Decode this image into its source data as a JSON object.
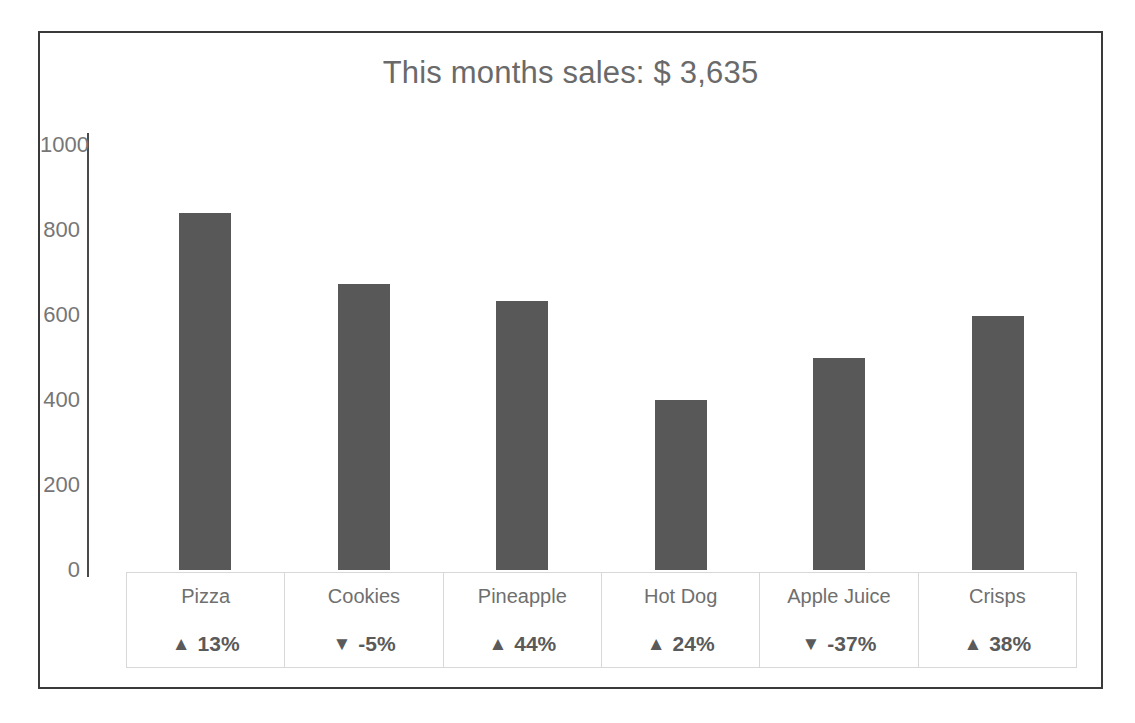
{
  "chart_data": {
    "type": "bar",
    "title": "This months sales: $ 3,635",
    "xlabel": "",
    "ylabel": "",
    "categories": [
      "Pizza",
      "Cookies",
      "Pineapple",
      "Hot Dog",
      "Apple Juice",
      "Crisps"
    ],
    "values": [
      840,
      672,
      632,
      400,
      500,
      598
    ],
    "ylim": [
      0,
      1000
    ],
    "yticks": [
      0,
      200,
      400,
      600,
      800,
      1000
    ],
    "ytick_labels": [
      "0",
      "200",
      "400",
      "600",
      "800",
      "1000"
    ],
    "grid": false,
    "legend": "none",
    "bar_color": "#585858",
    "data_table": {
      "show": true,
      "rows": [
        {
          "category": "Pizza",
          "delta_label": "13%",
          "direction": "up",
          "marker": "▲"
        },
        {
          "category": "Cookies",
          "delta_label": "-5%",
          "direction": "down",
          "marker": "▼"
        },
        {
          "category": "Pineapple",
          "delta_label": "44%",
          "direction": "up",
          "marker": "▲"
        },
        {
          "category": "Hot Dog",
          "delta_label": "24%",
          "direction": "up",
          "marker": "▲"
        },
        {
          "category": "Apple Juice",
          "delta_label": "-37%",
          "direction": "down",
          "marker": "▼"
        },
        {
          "category": "Crisps",
          "delta_label": "38%",
          "direction": "up",
          "marker": "▲"
        }
      ]
    }
  },
  "style": {
    "frame_border_color": "#3a3a3a",
    "axis_color": "#4a4a4a",
    "tick_text_color": "#767676",
    "title_text_color": "#6a6a6a",
    "table_border_color": "#d8d8d8",
    "background": "#ffffff"
  }
}
